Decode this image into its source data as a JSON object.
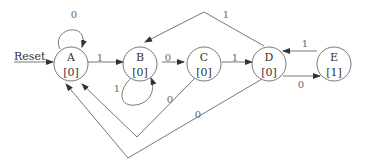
{
  "diagram": {
    "type": "state-machine",
    "reset_label": "Reset",
    "states": [
      {
        "id": "A",
        "name": "A",
        "output": "[0]"
      },
      {
        "id": "B",
        "name": "B",
        "output": "[0]"
      },
      {
        "id": "C",
        "name": "C",
        "output": "[0]"
      },
      {
        "id": "D",
        "name": "D",
        "output": "[0]"
      },
      {
        "id": "E",
        "name": "E",
        "output": "[1]"
      }
    ],
    "transitions": [
      {
        "from": "A",
        "to": "A",
        "label": "0"
      },
      {
        "from": "A",
        "to": "B",
        "label": "1"
      },
      {
        "from": "B",
        "to": "B",
        "label": "1"
      },
      {
        "from": "B",
        "to": "C",
        "label": "0"
      },
      {
        "from": "C",
        "to": "D",
        "label": "1"
      },
      {
        "from": "C",
        "to": "A",
        "label": "0"
      },
      {
        "from": "D",
        "to": "E",
        "label": "0"
      },
      {
        "from": "D",
        "to": "B",
        "label": "1"
      },
      {
        "from": "D",
        "to": "A",
        "label": "0"
      },
      {
        "from": "E",
        "to": "D",
        "label": "1"
      }
    ],
    "colors": {
      "line": "#777777",
      "text": "#333333",
      "label": "#666666"
    }
  }
}
